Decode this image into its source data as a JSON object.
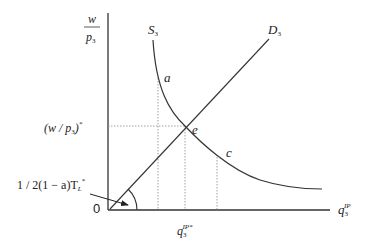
{
  "diagram": {
    "y_axis_label": {
      "numerator": "w",
      "denominator": "p",
      "denominator_sub": "3"
    },
    "x_axis_label": {
      "base": "q",
      "sub": "3",
      "sup": "IP"
    },
    "origin_label": "0",
    "supply_curve_label": {
      "base": "S",
      "sub": "3"
    },
    "demand_curve_label": {
      "base": "D",
      "sub": "3"
    },
    "points": {
      "a": "a",
      "e": "e",
      "c": "c"
    },
    "equilibrium_price_label": {
      "text": "(w / p",
      "sub": "3",
      "close": ")",
      "sup": "*"
    },
    "equilibrium_quantity_label": {
      "base": "q",
      "sub": "3",
      "sup": "IP*"
    },
    "angle_annotation": {
      "text": "1 / 2(1 − a)T",
      "sub": "L",
      "sup": "*"
    }
  },
  "colors": {
    "axis": "#333333",
    "curve": "#333333",
    "guide": "#777777",
    "text": "#222222"
  }
}
